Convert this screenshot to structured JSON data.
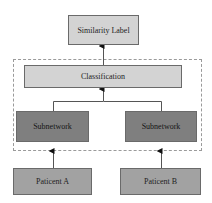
{
  "diagram": {
    "nodes": {
      "similarity_label": "Similarity Label",
      "classification": "Classification",
      "subnetwork_left": "Subnetwork",
      "subnetwork_right": "Subnetwork",
      "patient_a": "Paticent A",
      "patient_b": "Paticent B"
    },
    "edges": [
      {
        "from": "patient_a",
        "to": "subnetwork_left"
      },
      {
        "from": "patient_b",
        "to": "subnetwork_right"
      },
      {
        "from": "subnetwork_left",
        "to": "classification"
      },
      {
        "from": "subnetwork_right",
        "to": "classification"
      },
      {
        "from": "classification",
        "to": "similarity_label"
      }
    ],
    "group": "dashed container around classification and subnetworks",
    "colors": {
      "top_boxes": "#d3d3d3",
      "subnetwork_boxes": "#7f7f7f",
      "patient_boxes": "#a2a2a2",
      "dashed_border": "#9a9a9a"
    }
  }
}
